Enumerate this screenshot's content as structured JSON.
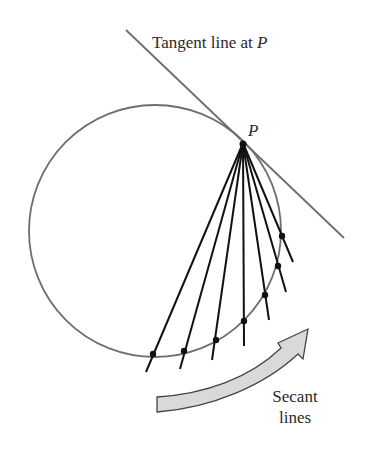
{
  "diagram": {
    "title_label": "Tangent line at ",
    "title_var": "P",
    "point_label": "P",
    "secant_label_line1": "Secant",
    "secant_label_line2": "lines",
    "colors": {
      "circle": "#6e6e6e",
      "tangent": "#6e6e6e",
      "secant": "#111111",
      "arrow_fill": "#d9d9d9",
      "arrow_stroke": "#444444"
    },
    "circle": {
      "cx": 155,
      "cy": 231,
      "r": 126
    },
    "point_P": {
      "x": 243,
      "y": 143
    },
    "tangent_line": {
      "x1": 126,
      "y1": 30,
      "x2": 344,
      "y2": 238
    },
    "secants": [
      {
        "dot": [
          153,
          354
        ],
        "end": [
          146,
          372
        ]
      },
      {
        "dot": [
          184,
          351
        ],
        "end": [
          180,
          369
        ]
      },
      {
        "dot": [
          216,
          340
        ],
        "end": [
          212,
          360
        ]
      },
      {
        "dot": [
          244,
          321
        ],
        "end": [
          244,
          346
        ]
      },
      {
        "dot": [
          265,
          295
        ],
        "end": [
          269,
          320
        ]
      },
      {
        "dot": [
          278,
          266
        ],
        "end": [
          286,
          292
        ]
      },
      {
        "dot": [
          282,
          236
        ],
        "end": [
          293,
          262
        ]
      }
    ]
  }
}
